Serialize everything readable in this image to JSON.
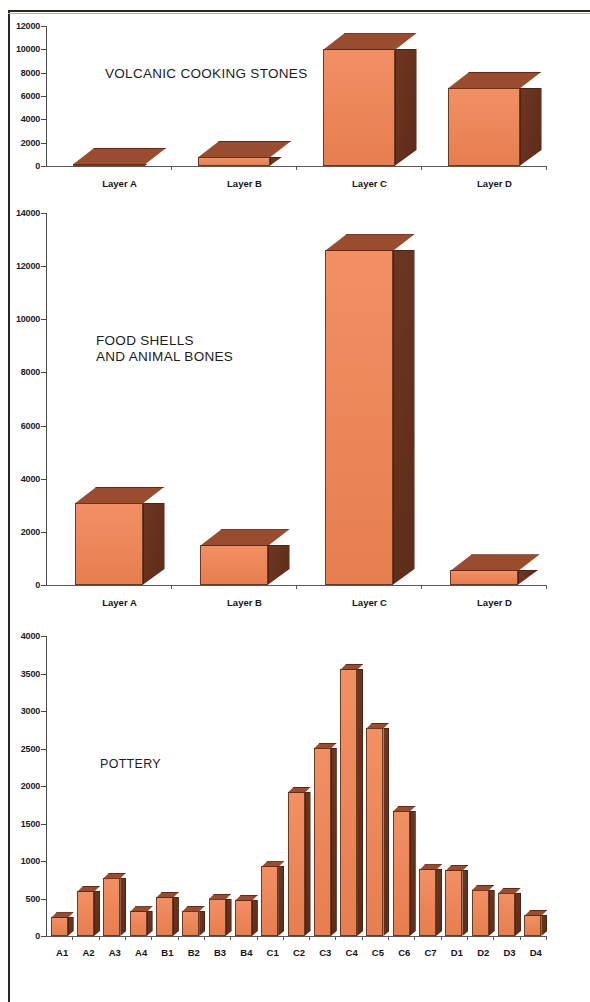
{
  "page": {
    "background": "#ffffff",
    "frame_color": "#15120f"
  },
  "palette": {
    "bar_front": "#f08352",
    "bar_side": "#6e3621",
    "bar_top": "#9a4d2e",
    "axis": "#4a4a4a",
    "text": "#1a1a1a"
  },
  "charts": [
    {
      "id": "volcanic-cooking-stones",
      "title": "VOLCANIC COOKING STONES",
      "categories": [
        "Layer A",
        "Layer B",
        "Layer C",
        "Layer D"
      ],
      "values": [
        200,
        800,
        10000,
        6700
      ],
      "yticks": [
        "0",
        "2000",
        "4000",
        "6000",
        "8000",
        "10000",
        "12000"
      ],
      "ymax": 12000
    },
    {
      "id": "food-shells-and-animal-bones",
      "title": "FOOD SHELLS\nAND ANIMAL BONES",
      "categories": [
        "Layer A",
        "Layer B",
        "Layer C",
        "Layer D"
      ],
      "values": [
        3100,
        1500,
        12600,
        550
      ],
      "yticks": [
        "0",
        "2000",
        "4000",
        "6000",
        "8000",
        "10000",
        "12000",
        "14000"
      ],
      "ymax": 14000
    },
    {
      "id": "pottery",
      "title": "POTTERY",
      "categories": [
        "A1",
        "A2",
        "A3",
        "A4",
        "B1",
        "B2",
        "B3",
        "B4",
        "C1",
        "C2",
        "C3",
        "C4",
        "C5",
        "C6",
        "C7",
        "D1",
        "D2",
        "D3",
        "D4"
      ],
      "values": [
        250,
        600,
        780,
        330,
        520,
        340,
        500,
        480,
        930,
        1920,
        2510,
        3560,
        2780,
        1670,
        890,
        880,
        620,
        580,
        280
      ],
      "yticks": [
        "0",
        "500",
        "1000",
        "1500",
        "2000",
        "2500",
        "3000",
        "3500",
        "4000"
      ],
      "ymax": 4000
    }
  ],
  "chart_data": [
    {
      "type": "bar",
      "title": "VOLCANIC COOKING STONES",
      "categories": [
        "Layer A",
        "Layer B",
        "Layer C",
        "Layer D"
      ],
      "values": [
        200,
        800,
        10000,
        6700
      ],
      "xlabel": "",
      "ylabel": "",
      "ylim": [
        0,
        12000
      ],
      "ytick_step": 2000,
      "grid": false,
      "legend": "none",
      "style": "3d-bar"
    },
    {
      "type": "bar",
      "title": "FOOD SHELLS AND ANIMAL BONES",
      "categories": [
        "Layer A",
        "Layer B",
        "Layer C",
        "Layer D"
      ],
      "values": [
        3100,
        1500,
        12600,
        550
      ],
      "xlabel": "",
      "ylabel": "",
      "ylim": [
        0,
        14000
      ],
      "ytick_step": 2000,
      "grid": false,
      "legend": "none",
      "style": "3d-bar"
    },
    {
      "type": "bar",
      "title": "POTTERY",
      "categories": [
        "A1",
        "A2",
        "A3",
        "A4",
        "B1",
        "B2",
        "B3",
        "B4",
        "C1",
        "C2",
        "C3",
        "C4",
        "C5",
        "C6",
        "C7",
        "D1",
        "D2",
        "D3",
        "D4"
      ],
      "values": [
        250,
        600,
        780,
        330,
        520,
        340,
        500,
        480,
        930,
        1920,
        2510,
        3560,
        2780,
        1670,
        890,
        880,
        620,
        580,
        280
      ],
      "xlabel": "",
      "ylabel": "",
      "ylim": [
        0,
        4000
      ],
      "ytick_step": 500,
      "grid": false,
      "legend": "none",
      "style": "3d-bar"
    }
  ]
}
